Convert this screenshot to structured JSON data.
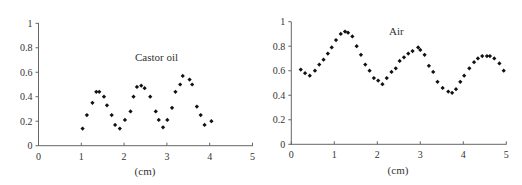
{
  "chart_data": [
    {
      "type": "scatter",
      "title": "Castor oil",
      "xlabel": "(cm)",
      "ylabel": "",
      "xlim": [
        0,
        5
      ],
      "ylim": [
        0,
        1
      ],
      "xticks": [
        "0",
        "1",
        "2",
        "3",
        "4",
        "5"
      ],
      "yticks": [
        "0",
        "0.2",
        "0.4",
        "0.6",
        "0.8",
        "1"
      ],
      "grid": false,
      "legend": null,
      "annotation": "Castor oil",
      "x": [
        1.03,
        1.13,
        1.26,
        1.35,
        1.42,
        1.53,
        1.6,
        1.71,
        1.79,
        1.9,
        2.02,
        2.15,
        2.22,
        2.3,
        2.4,
        2.48,
        2.61,
        2.74,
        2.81,
        2.91,
        3.01,
        3.12,
        3.2,
        3.31,
        3.37,
        3.53,
        3.59,
        3.7,
        3.79,
        3.88,
        4.04
      ],
      "y": [
        0.14,
        0.25,
        0.35,
        0.44,
        0.44,
        0.4,
        0.33,
        0.25,
        0.17,
        0.14,
        0.21,
        0.28,
        0.4,
        0.48,
        0.49,
        0.47,
        0.4,
        0.28,
        0.21,
        0.15,
        0.21,
        0.31,
        0.44,
        0.5,
        0.57,
        0.54,
        0.5,
        0.32,
        0.25,
        0.17,
        0.2
      ]
    },
    {
      "type": "scatter",
      "title": "Air",
      "xlabel": "(cm)",
      "ylabel": "",
      "xlim": [
        0,
        5
      ],
      "ylim": [
        0,
        1
      ],
      "xticks": [
        "0",
        "1",
        "2",
        "3",
        "4",
        "5"
      ],
      "yticks": [
        "0",
        "0.2",
        "0.4",
        "0.6",
        "0.8",
        "1"
      ],
      "grid": false,
      "legend": null,
      "annotation": "Air",
      "x": [
        0.22,
        0.32,
        0.43,
        0.55,
        0.65,
        0.75,
        0.85,
        0.94,
        1.04,
        1.15,
        1.25,
        1.32,
        1.42,
        1.52,
        1.62,
        1.72,
        1.82,
        1.92,
        2.02,
        2.12,
        2.22,
        2.33,
        2.43,
        2.52,
        2.62,
        2.72,
        2.82,
        2.95,
        3.0,
        3.1,
        3.2,
        3.3,
        3.4,
        3.52,
        3.65,
        3.74,
        3.83,
        3.93,
        4.02,
        4.14,
        4.25,
        4.34,
        4.44,
        4.55,
        4.62,
        4.72,
        4.84,
        4.94
      ],
      "y": [
        0.61,
        0.58,
        0.56,
        0.6,
        0.65,
        0.69,
        0.74,
        0.79,
        0.85,
        0.9,
        0.92,
        0.91,
        0.88,
        0.8,
        0.73,
        0.65,
        0.6,
        0.54,
        0.52,
        0.49,
        0.54,
        0.59,
        0.62,
        0.68,
        0.71,
        0.74,
        0.76,
        0.79,
        0.77,
        0.73,
        0.64,
        0.59,
        0.51,
        0.46,
        0.43,
        0.42,
        0.45,
        0.51,
        0.56,
        0.62,
        0.67,
        0.7,
        0.72,
        0.72,
        0.72,
        0.7,
        0.66,
        0.6
      ]
    }
  ],
  "charts": [
    {
      "annotation": "Castor oil",
      "xlabel": "(cm)",
      "xticks": [
        "0",
        "1",
        "2",
        "3",
        "4",
        "5"
      ],
      "yticks": [
        "0",
        "0.2",
        "0.4",
        "0.6",
        "0.8",
        "1"
      ]
    },
    {
      "annotation": "Air",
      "xlabel": "(cm)",
      "xticks": [
        "0",
        "1",
        "2",
        "3",
        "4",
        "5"
      ],
      "yticks": [
        "0",
        "0.2",
        "0.4",
        "0.6",
        "0.8",
        "1"
      ]
    }
  ],
  "style": {
    "axis_color": "#666666",
    "point_color": "#111111",
    "text_color": "#333333"
  }
}
